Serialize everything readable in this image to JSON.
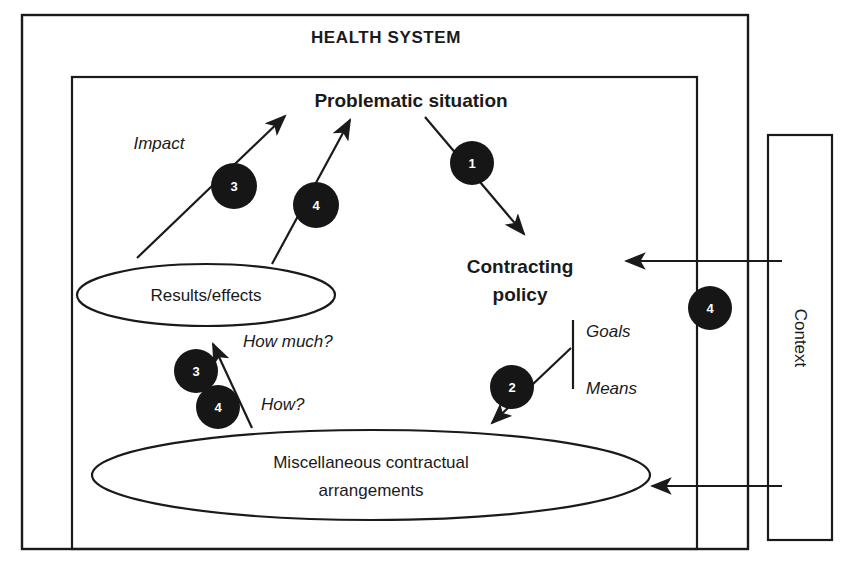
{
  "diagram": {
    "title": "Health system",
    "outer_box_label": "HEALTH SYSTEM",
    "context_box_label": "Context",
    "nodes": {
      "problematic_situation": "Problematic situation",
      "contracting_line1": "Contracting",
      "contracting_line2": "policy",
      "results_effects": "Results/effects",
      "misc_line1": "Miscellaneous contractual",
      "misc_line2": "arrangements"
    },
    "annotations": {
      "impact": "Impact",
      "goals": "Goals",
      "means": "Means",
      "how_much": "How much?",
      "how": "How?"
    },
    "step_badges": [
      {
        "id": "badge-1",
        "label": "1",
        "x": 472,
        "y": 163,
        "r": 22
      },
      {
        "id": "badge-2",
        "label": "2",
        "x": 512,
        "y": 387,
        "r": 22
      },
      {
        "id": "badge-3-impact",
        "label": "3",
        "x": 234,
        "y": 186,
        "r": 23
      },
      {
        "id": "badge-4-impact",
        "label": "4",
        "x": 316,
        "y": 205,
        "r": 23
      },
      {
        "id": "badge-3-how-much",
        "label": "3",
        "x": 196,
        "y": 371,
        "r": 22
      },
      {
        "id": "badge-4-how",
        "label": "4",
        "x": 218,
        "y": 407,
        "r": 22
      },
      {
        "id": "badge-4-context",
        "label": "4",
        "x": 710,
        "y": 308,
        "r": 22
      }
    ],
    "colors": {
      "stroke": "#1a1a1a",
      "badge_fill": "#161616",
      "badge_text": "#ffffff",
      "background": "#ffffff"
    }
  }
}
